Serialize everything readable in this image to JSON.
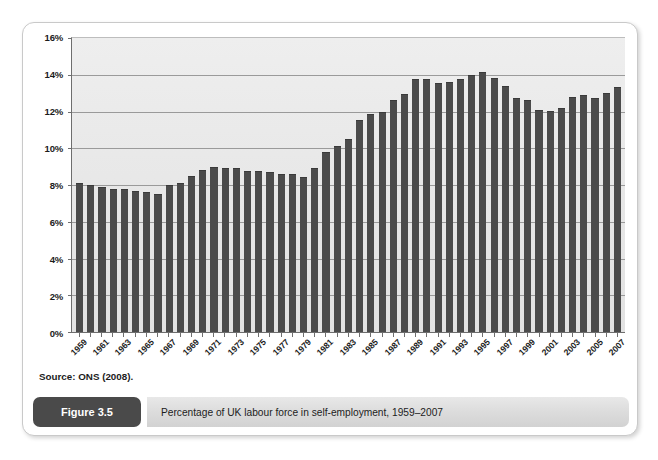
{
  "figure": {
    "tag_label": "Figure 3.5",
    "caption": "Percentage of UK labour force in self-employment, 1959–2007",
    "source": "Source: ONS (2008)."
  },
  "colors": {
    "bar": "#4b4b4b",
    "plot_background": "#e9e9e9",
    "gridline": "#9a9a9a",
    "axis": "#6e6e6e",
    "tag_background": "#4a4a4a",
    "caption_background": "#dcdcdc"
  },
  "chart_data": {
    "type": "bar",
    "title": "Percentage of UK labour force in self-employment, 1959–2007",
    "xlabel": "",
    "ylabel": "",
    "ylim": [
      0,
      16
    ],
    "y_ticks": [
      0,
      2,
      4,
      6,
      8,
      10,
      12,
      14,
      16
    ],
    "y_tick_labels": [
      "0%",
      "2%",
      "4%",
      "6%",
      "8%",
      "10%",
      "12%",
      "14%",
      "16%"
    ],
    "grid": true,
    "legend": "none",
    "x_tick_labels": [
      "1959",
      "1961",
      "1963",
      "1965",
      "1967",
      "1969",
      "1971",
      "1973",
      "1975",
      "1977",
      "1979",
      "1981",
      "1983",
      "1985",
      "1987",
      "1989",
      "1991",
      "1993",
      "1995",
      "1997",
      "1999",
      "2001",
      "2003",
      "2005",
      "2007"
    ],
    "categories": [
      "1959",
      "1960",
      "1961",
      "1962",
      "1963",
      "1964",
      "1965",
      "1966",
      "1967",
      "1968",
      "1969",
      "1970",
      "1971",
      "1972",
      "1973",
      "1974",
      "1975",
      "1976",
      "1977",
      "1978",
      "1979",
      "1980",
      "1981",
      "1982",
      "1983",
      "1984",
      "1985",
      "1986",
      "1987",
      "1988",
      "1989",
      "1990",
      "1991",
      "1992",
      "1993",
      "1994",
      "1995",
      "1996",
      "1997",
      "1998",
      "1999",
      "2000",
      "2001",
      "2002",
      "2003",
      "2004",
      "2005",
      "2006",
      "2007"
    ],
    "values": [
      8.1,
      8.0,
      7.9,
      7.8,
      7.8,
      7.7,
      7.6,
      7.5,
      8.0,
      8.1,
      8.5,
      8.8,
      9.0,
      8.9,
      8.9,
      8.75,
      8.75,
      8.7,
      8.6,
      8.6,
      8.45,
      8.95,
      9.8,
      10.15,
      10.5,
      11.55,
      11.85,
      12.0,
      12.6,
      12.95,
      13.75,
      13.75,
      13.55,
      13.6,
      13.75,
      14.0,
      14.15,
      13.85,
      13.4,
      12.75,
      12.65,
      12.1,
      12.05,
      12.2,
      12.8,
      12.9,
      12.75,
      13.0,
      13.35
    ],
    "units": "percent",
    "series_name": "UK labour force in self-employment"
  }
}
